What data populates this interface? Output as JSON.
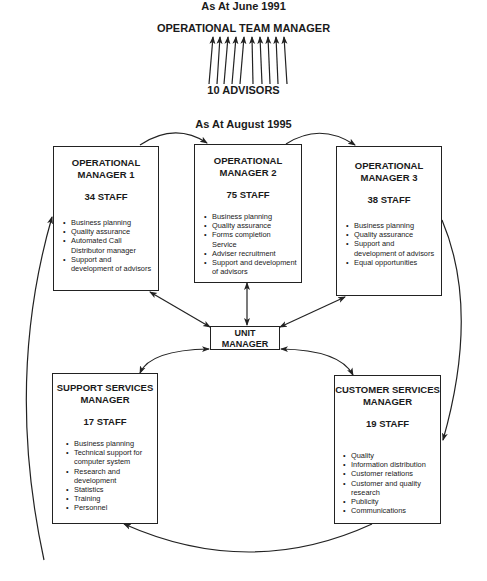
{
  "top_section": {
    "date_label": "As At June 1991",
    "manager_label": "OPERATIONAL TEAM  MANAGER",
    "advisors_label": "10 ADVISORS",
    "arrow_count": 10
  },
  "main_section": {
    "date_label": "As At August 1995",
    "unit_manager": {
      "line1": "UNIT",
      "line2": "MANAGER"
    },
    "boxes": [
      {
        "title_line1": "OPERATIONAL",
        "title_line2": "MANAGER 1",
        "staff": "34 STAFF",
        "items": [
          "Business planning",
          "Quality assurance",
          "Automated Call Distributor manager",
          "Support and development of advisors"
        ]
      },
      {
        "title_line1": "OPERATIONAL",
        "title_line2": "MANAGER 2",
        "staff": "75 STAFF",
        "items": [
          "Business planning",
          "Quality assurance",
          "Forms completion Service",
          "Adviser recruitment",
          "Support and development of advisors"
        ]
      },
      {
        "title_line1": "OPERATIONAL",
        "title_line2": "MANAGER 3",
        "staff": "38 STAFF",
        "items": [
          "Business planning",
          "Quality assurance",
          "Support and development of advisors",
          "Equal opportunities"
        ]
      },
      {
        "title_line1": "SUPPORT SERVICES",
        "title_line2": "MANAGER",
        "staff": "17 STAFF",
        "items": [
          "Business planning",
          "Technical support for computer system",
          "Research and development",
          "Statistics",
          "Training",
          "Personnel"
        ]
      },
      {
        "title_line1": "CUSTOMER SERVICES",
        "title_line2": "MANAGER",
        "staff": "19 STAFF",
        "items": [
          "Quality",
          "Information distribution",
          "Customer relations",
          "Customer and quality research",
          "Publicity",
          "Communications"
        ]
      }
    ]
  }
}
